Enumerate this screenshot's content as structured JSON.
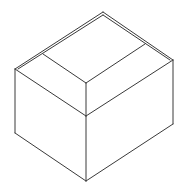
{
  "figure": {
    "stroke_color": "#3a3a3a",
    "background": "#ffffff",
    "vertices": {
      "top": [
        103,
        12
      ],
      "top_inner": [
        103,
        15
      ],
      "left_top": [
        15,
        69
      ],
      "right_top": [
        173,
        60
      ],
      "front_upper": [
        86,
        83
      ],
      "front_middle": [
        86,
        116
      ],
      "left_bottom": [
        15,
        133
      ],
      "right_bottom": [
        173,
        124
      ],
      "bottom": [
        86,
        181
      ],
      "lid_left": [
        43,
        54
      ],
      "lid_right": [
        145,
        44
      ]
    },
    "edges": [
      {
        "name": "top-left-outer",
        "points": "15,69 103,12"
      },
      {
        "name": "top-left-inner",
        "points": "18,69 103,15"
      },
      {
        "name": "top-right-outer",
        "points": "103,12 173,60"
      },
      {
        "name": "top-right-inner",
        "points": "103,15 170,60"
      },
      {
        "name": "lid-left-edge",
        "points": "43,54 86,83"
      },
      {
        "name": "lid-right-edge",
        "points": "86,83 145,44"
      },
      {
        "name": "front-upper-vertical",
        "points": "86,83 86,116"
      },
      {
        "name": "left-top-to-middle",
        "points": "15,69 86,116"
      },
      {
        "name": "middle-to-right-top",
        "points": "86,116 173,60"
      },
      {
        "name": "left-vertical",
        "points": "15,69 15,133"
      },
      {
        "name": "right-vertical",
        "points": "173,60 173,124"
      },
      {
        "name": "front-lower-vertical",
        "points": "86,116 86,181"
      },
      {
        "name": "left-bottom-edge",
        "points": "15,133 86,181"
      },
      {
        "name": "right-bottom-edge",
        "points": "86,181 173,124"
      }
    ]
  }
}
